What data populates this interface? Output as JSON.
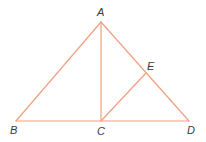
{
  "diagram": {
    "type": "geometry",
    "line_color": "#F0A080",
    "label_color": "#3a3a3a",
    "points": {
      "A": {
        "x": 101,
        "y": 22,
        "label": "A",
        "lx": 97,
        "ly": 16
      },
      "B": {
        "x": 16,
        "y": 121,
        "label": "B",
        "lx": 10,
        "ly": 134
      },
      "C": {
        "x": 101,
        "y": 121,
        "label": "C",
        "lx": 97,
        "ly": 135
      },
      "D": {
        "x": 189,
        "y": 121,
        "label": "D",
        "lx": 187,
        "ly": 134
      },
      "E": {
        "x": 146,
        "y": 73,
        "label": "E",
        "lx": 147,
        "ly": 70
      }
    },
    "segments": [
      {
        "from": "A",
        "to": "B"
      },
      {
        "from": "A",
        "to": "D"
      },
      {
        "from": "B",
        "to": "D"
      },
      {
        "from": "A",
        "to": "C"
      },
      {
        "from": "C",
        "to": "E"
      }
    ]
  }
}
